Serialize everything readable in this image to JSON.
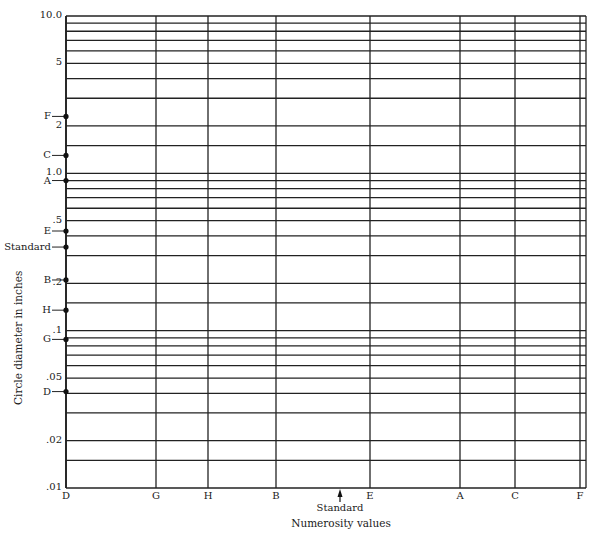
{
  "chart_data": {
    "type": "scatter",
    "title": "",
    "xlabel": "Numerosity values",
    "ylabel": "Circle diameter in inches",
    "yscale": "log",
    "ylim": [
      0.01,
      10.0
    ],
    "grid": true,
    "y_tick_labels": [
      {
        "label": "10.0",
        "value": 10.0
      },
      {
        "label": "5",
        "value": 5
      },
      {
        "label": "2",
        "value": 2
      },
      {
        "label": "1.0",
        "value": 1.0
      },
      {
        "label": ".5",
        "value": 0.5
      },
      {
        "label": ".2",
        "value": 0.2
      },
      {
        "label": ".1",
        "value": 0.1
      },
      {
        "label": ".05",
        "value": 0.05
      },
      {
        "label": ".02",
        "value": 0.02
      },
      {
        "label": ".01",
        "value": 0.01
      }
    ],
    "y_gridlines": [
      10,
      9,
      8,
      7,
      6,
      5,
      4,
      3,
      2,
      1.5,
      1.0,
      0.9,
      0.8,
      0.7,
      0.6,
      0.5,
      0.4,
      0.3,
      0.2,
      0.15,
      0.1,
      0.09,
      0.08,
      0.07,
      0.06,
      0.05,
      0.04,
      0.03,
      0.02,
      0.015,
      0.01
    ],
    "x_categories": [
      "D",
      "G",
      "H",
      "B",
      "E",
      "A",
      "C",
      "F"
    ],
    "x_positions_px": [
      66,
      156,
      208,
      276,
      370,
      460,
      515,
      580
    ],
    "x_marker": {
      "label": "Standard",
      "position_px": 340
    },
    "points_on_y_axis": [
      {
        "label": "F",
        "value": 2.3
      },
      {
        "label": "C",
        "value": 1.3
      },
      {
        "label": "A",
        "value": 0.9
      },
      {
        "label": "E",
        "value": 0.43
      },
      {
        "label": "Standard",
        "value": 0.34
      },
      {
        "label": "B",
        "value": 0.21
      },
      {
        "label": "H",
        "value": 0.135
      },
      {
        "label": "G",
        "value": 0.088
      },
      {
        "label": "D",
        "value": 0.041
      }
    ],
    "legend": null
  },
  "axis": {
    "ylabel": "Circle diameter in inches",
    "xlabel": "Numerosity values",
    "standard_label": "Standard"
  }
}
